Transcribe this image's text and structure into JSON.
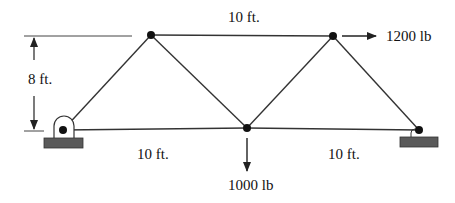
{
  "diagram": {
    "type": "truss",
    "colors": {
      "member": "#333333",
      "node": "#111111",
      "support_base": "#5a5a5a",
      "text": "#111111"
    },
    "labels": {
      "top_span": "10 ft.",
      "height": "8 ft.",
      "bottom_left_span": "10 ft.",
      "bottom_right_span": "10 ft.",
      "horizontal_load": "1200 lb",
      "vertical_load": "1000 lb"
    },
    "nodes": [
      {
        "id": "A",
        "role": "left-pin-support"
      },
      {
        "id": "B",
        "role": "top-left"
      },
      {
        "id": "C",
        "role": "bottom-middle"
      },
      {
        "id": "D",
        "role": "top-right"
      },
      {
        "id": "E",
        "role": "right-roller-support"
      }
    ],
    "members": [
      "A-B",
      "A-C",
      "B-C",
      "B-D",
      "C-D",
      "C-E",
      "D-E"
    ]
  }
}
